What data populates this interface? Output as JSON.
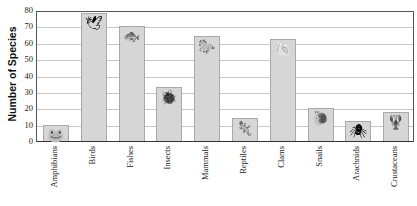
{
  "chart_data": {
    "type": "bar",
    "title": "",
    "xlabel": "",
    "ylabel": "Number of Species",
    "ylim": [
      0,
      80
    ],
    "yticks": [
      0,
      10,
      20,
      30,
      40,
      50,
      60,
      70,
      80
    ],
    "grid": true,
    "categories": [
      "Amphibians",
      "Birds",
      "Fishes",
      "Insects",
      "Mammals",
      "Reptiles",
      "Clams",
      "Snails",
      "Arachnids",
      "Crustaceans"
    ],
    "values": [
      10,
      78,
      70,
      33,
      64,
      14,
      62,
      20,
      12,
      18
    ],
    "annotations": [
      "frog-picture",
      "bird-picture",
      "fish-picture",
      "beetle-picture",
      "horse-picture",
      "lizard-picture",
      "clam-picture",
      "snail-picture",
      "spider-picture",
      "lobster-picture"
    ]
  },
  "axis": {
    "ylabel": "Number of Species",
    "ticks": [
      "0",
      "10",
      "20",
      "30",
      "40",
      "50",
      "60",
      "70",
      "80"
    ]
  },
  "labels": [
    "Amphibians",
    "Birds",
    "Fishes",
    "Insects",
    "Mammals",
    "Reptiles",
    "Clams",
    "Snails",
    "Arachnids",
    "Crustaceans"
  ],
  "icons": [
    "🐸",
    "🕊",
    "🐟",
    "🐞",
    "🐎",
    "🦎",
    "🐚",
    "🐌",
    "🕷",
    "🦞"
  ]
}
